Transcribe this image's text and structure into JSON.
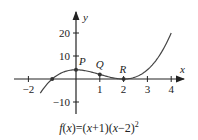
{
  "chart_data": {
    "type": "line",
    "title": "",
    "function": "f(x)=(x+1)(x-2)^2",
    "xlabel": "x",
    "ylabel": "y",
    "xlim": [
      -2.3,
      4.6
    ],
    "ylim": [
      -14,
      28
    ],
    "x_ticks": [
      -2,
      1,
      2,
      3,
      4
    ],
    "x_tick_labels": [
      "−2",
      "1",
      "2",
      "3",
      "4"
    ],
    "y_ticks": [
      20,
      10,
      -10
    ],
    "y_tick_labels": [
      "20",
      "10",
      "−10"
    ],
    "grid": false,
    "series": [
      {
        "name": "f(x)",
        "x": [
          -1.5,
          -1,
          -0.5,
          0,
          0.5,
          1,
          1.5,
          2,
          2.5,
          3,
          3.5,
          4
        ],
        "values": [
          -6.125,
          0,
          3.125,
          4,
          3.375,
          2,
          0.625,
          0,
          0.875,
          4,
          10.125,
          20
        ]
      }
    ],
    "points": [
      {
        "label": "P",
        "x": 0,
        "y": 4
      },
      {
        "label": "Q",
        "x": 1,
        "y": 2
      },
      {
        "label": "R",
        "x": 2,
        "y": 0
      },
      {
        "label": "",
        "x": -1,
        "y": 0
      }
    ],
    "caption": "f(x)=(x+1)(x−2)²"
  },
  "caption": {
    "f": "f",
    "x1": "x",
    "mid": ")=(",
    "x2": "x",
    "plus": "+1)(",
    "x3": "x",
    "minus": "−2)",
    "exp": "2"
  }
}
